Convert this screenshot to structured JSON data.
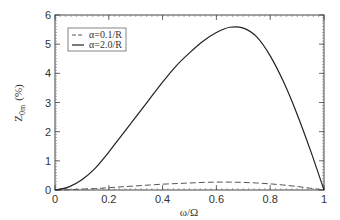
{
  "chart_data": {
    "type": "line",
    "title": "",
    "xlabel": "ω/Ω",
    "ylabel": "Z_0m (%)",
    "ylabel_main": "Z",
    "ylabel_sub": "0m",
    "ylabel_unit": "(%)",
    "xlim": [
      0,
      1
    ],
    "ylim": [
      0,
      6
    ],
    "xticks": [
      0,
      0.2,
      0.4,
      0.6,
      0.8,
      1
    ],
    "xtick_labels": [
      "0",
      "0.2",
      "0.4",
      "0.6",
      "0.8",
      "1"
    ],
    "yticks": [
      0,
      1,
      2,
      3,
      4,
      5,
      6
    ],
    "ytick_labels": [
      "0",
      "1",
      "2",
      "3",
      "4",
      "5",
      "6"
    ],
    "grid": false,
    "legend_position": "upper left",
    "x": [
      0,
      0.05,
      0.1,
      0.15,
      0.2,
      0.25,
      0.3,
      0.35,
      0.4,
      0.45,
      0.5,
      0.55,
      0.6,
      0.65,
      0.7,
      0.75,
      0.8,
      0.85,
      0.9,
      0.95,
      1.0
    ],
    "series": [
      {
        "name": "α=0.1/R",
        "style": "dashed",
        "color": "#555555",
        "values": [
          0,
          0.01,
          0.03,
          0.05,
          0.08,
          0.11,
          0.14,
          0.17,
          0.2,
          0.22,
          0.24,
          0.26,
          0.27,
          0.27,
          0.26,
          0.24,
          0.21,
          0.17,
          0.12,
          0.06,
          0
        ]
      },
      {
        "name": "α=2.0/R",
        "style": "solid",
        "color": "#222222",
        "values": [
          0,
          0.1,
          0.35,
          0.75,
          1.3,
          1.9,
          2.5,
          3.1,
          3.7,
          4.25,
          4.7,
          5.1,
          5.4,
          5.58,
          5.55,
          5.25,
          4.6,
          3.7,
          2.6,
          1.35,
          0
        ]
      }
    ]
  }
}
